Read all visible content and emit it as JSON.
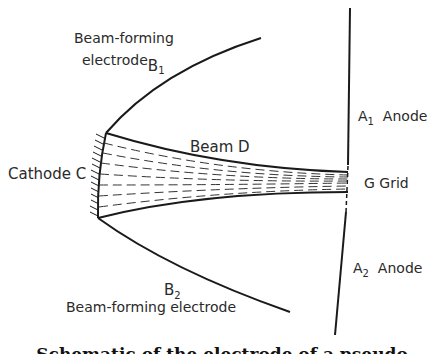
{
  "labels": {
    "b1_line1": "Beam-forming",
    "b1_line2": "electrode",
    "b1_symbol": "B",
    "b1_sub": "1",
    "b2_symbol": "B",
    "b2_sub": "2",
    "b2_text": "Beam-forming electrode",
    "cathode": "Cathode C",
    "beam": "Beam D",
    "a1_symbol": "A",
    "a1_sub": "1",
    "a1_text": "Anode",
    "grid": "G  Grid",
    "a2_symbol": "A",
    "a2_sub": "2",
    "a2_text": "Anode"
  },
  "caption": "Schematic of the electrode of a pseudo",
  "colors": {
    "line": "#1a1a1a",
    "text": "#2a2a2a",
    "background": "#ffffff"
  }
}
